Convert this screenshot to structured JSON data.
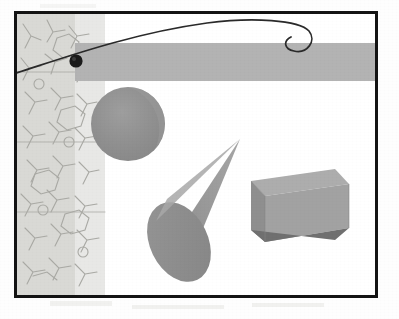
{
  "scene": {
    "title": "3D rendered geometry scene with trajectory arc",
    "canvas": {
      "width": 399,
      "height": 319
    },
    "background_color": "#ffffff",
    "paper_color": "#fefefe"
  },
  "frame": {
    "name": "picture-frame",
    "border_color": "#141414",
    "border_width_px": 3,
    "x": 14,
    "y": 11,
    "width": 364,
    "height": 287,
    "fill_color": "#ffffff"
  },
  "texture": {
    "label": "hand-drawn scribble texture panel",
    "strip_a": {
      "color": "#d9d9d5",
      "x": 0,
      "width": 58
    },
    "strip_b": {
      "color": "#e8e8e6",
      "x": 58,
      "width": 30
    },
    "stroke_color": "#a9a9a4",
    "stroke_width": 1.1
  },
  "band": {
    "label": "horizontal gray ground band",
    "color": "#b3b3b3",
    "x": 58,
    "y": 29,
    "height": 38
  },
  "arc": {
    "label": "trajectory arc with hook",
    "stroke_color": "#2a2a2a",
    "stroke_width": 1.6,
    "path": "M -4 78 C 40 58, 120 22, 200 14 C 250 10, 292 12, 300 22 C 307 31, 296 42, 284 40 C 274 38, 272 30, 280 26"
  },
  "marker": {
    "label": "position marker dot on arc",
    "fill_color": "#1b1b1b",
    "cx": 72,
    "cy": 57,
    "r": 6.5
  },
  "shapes": [
    {
      "id": "sphere",
      "name": "sphere",
      "type": "circle",
      "fill_color": "#8f8f8f",
      "highlight_color": "#9b9b9b",
      "cx": 125,
      "cy": 121,
      "r": 37
    },
    {
      "id": "cone",
      "name": "cone",
      "type": "cone",
      "body_color": "#909090",
      "lit_color": "#a3a3a3",
      "base_color": "#8c8c8c",
      "apex_x": 237,
      "apex_y": 136,
      "base_cx": 176,
      "base_cy": 240,
      "base_rx": 29,
      "base_ry": 14
    },
    {
      "id": "box",
      "name": "box",
      "type": "cuboid",
      "front_color": "#a0a0a0",
      "top_color": "#ababab",
      "side_color": "#8b8b8b",
      "bottom_color": "#6e6e6e",
      "x": 248,
      "y": 177,
      "width": 98,
      "height": 62
    }
  ],
  "smudges": [
    {
      "x": 50,
      "y": 300,
      "w": 60,
      "h": 6
    },
    {
      "x": 130,
      "y": 304,
      "w": 90,
      "h": 5
    },
    {
      "x": 250,
      "y": 302,
      "w": 70,
      "h": 5
    },
    {
      "x": 40,
      "y": 4,
      "w": 55,
      "h": 5
    }
  ]
}
